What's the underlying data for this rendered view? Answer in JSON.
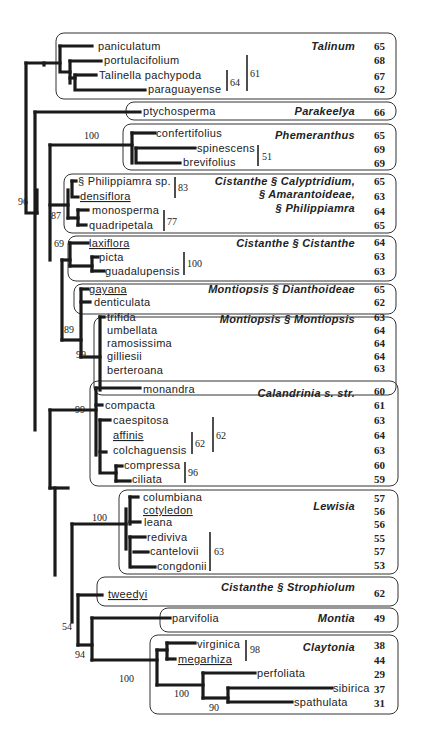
{
  "figure": {
    "groups": [
      {
        "name": "Talinum",
        "taxa": [
          {
            "label": "paniculatum",
            "value": "65"
          },
          {
            "label": "portulacifolium",
            "value": "68"
          },
          {
            "label": "Talinella pachypoda",
            "value": "67"
          },
          {
            "label": "paraguayense",
            "value": "62"
          }
        ]
      },
      {
        "name": "Parakeelya",
        "taxa": [
          {
            "label": "ptychosperma",
            "value": "66"
          }
        ]
      },
      {
        "name": "Phemeranthus",
        "taxa": [
          {
            "label": "confertifolius",
            "value": "65"
          },
          {
            "label": "spinescens",
            "value": "69"
          },
          {
            "label": "brevifolius",
            "value": "69"
          }
        ]
      },
      {
        "name_lines": [
          "Cistanthe § Calyptridium,",
          "§ Amarantoideae,",
          "§ Philippiamra"
        ],
        "taxa": [
          {
            "label": "§ Philippiamra sp.",
            "value": "65"
          },
          {
            "label": "densiflora",
            "value": "63",
            "underlined": true
          },
          {
            "label": "monosperma",
            "value": "64"
          },
          {
            "label": "quadripetala",
            "value": "65"
          }
        ]
      },
      {
        "name": "Cistanthe § Cistanthe",
        "taxa": [
          {
            "label": "laxiflora",
            "value": "64",
            "underlined": true
          },
          {
            "label": "picta",
            "value": "63"
          },
          {
            "label": "guadalupensis",
            "value": "63"
          }
        ]
      },
      {
        "name": "Montiopsis § Dianthoideae",
        "taxa": [
          {
            "label": "gayana",
            "value": "65",
            "underlined": true
          },
          {
            "label": "denticulata",
            "value": "62"
          }
        ]
      },
      {
        "name": "Montiopsis § Montiopsis",
        "taxa": [
          {
            "label": "trifida",
            "value": "63"
          },
          {
            "label": "umbellata",
            "value": "64"
          },
          {
            "label": "ramosissima",
            "value": "64"
          },
          {
            "label": "gilliesii",
            "value": "64"
          },
          {
            "label": "berteroana",
            "value": "63"
          }
        ]
      },
      {
        "name": "Calandrinia s. str.",
        "taxa": [
          {
            "label": "monandra",
            "value": "60"
          },
          {
            "label": "compacta",
            "value": "61"
          },
          {
            "label": "caespitosa",
            "value": "63"
          },
          {
            "label": "affinis",
            "value": "64",
            "underlined": true
          },
          {
            "label": "colchaguensis",
            "value": "63"
          },
          {
            "label": "compressa",
            "value": "60"
          },
          {
            "label": "ciliata",
            "value": "59"
          }
        ]
      },
      {
        "name": "Lewisia",
        "taxa": [
          {
            "label": "columbiana",
            "value": "57"
          },
          {
            "label": "cotyledon",
            "value": "56",
            "underlined": true
          },
          {
            "label": "leana",
            "value": "56"
          },
          {
            "label": "rediviva",
            "value": "55"
          },
          {
            "label": "cantelovii",
            "value": "57"
          },
          {
            "label": "congdonii",
            "value": "53"
          }
        ]
      },
      {
        "name": "Cistanthe § Strophiolum",
        "taxa": [
          {
            "label": "tweedyi",
            "value": "62",
            "underlined": true
          }
        ]
      },
      {
        "name": "Montia",
        "taxa": [
          {
            "label": "parvifolia",
            "value": "49"
          }
        ]
      },
      {
        "name": "Claytonia",
        "taxa": [
          {
            "label": "virginica",
            "value": "38"
          },
          {
            "label": "megarhiza",
            "value": "44",
            "underlined": true
          },
          {
            "label": "perfoliata",
            "value": "29"
          },
          {
            "label": "sibirica",
            "value": "37"
          },
          {
            "label": "spathulata",
            "value": "31"
          }
        ]
      }
    ],
    "support_values": {
      "talinum_inner": "64",
      "talinum_outer": "61",
      "phemeranthus_node": "100",
      "phemeranthus_bar": "51",
      "root_96": "96",
      "cistanthe_87": "87",
      "philippiamra_bar": "83",
      "monosperma_bar": "77",
      "cistanthe_69": "69",
      "guadalupensis_bar": "100",
      "montiopsis_89": "89",
      "montiopsis_99": "99",
      "calandrinia_99": "99",
      "colchaguensis_bar": "62",
      "caespitosa_bar": "62",
      "compressa_bar": "96",
      "lewisia_100": "100",
      "cantelovii_bar": "63",
      "node_54": "54",
      "node_94": "94",
      "montia_claytonia_100": "100",
      "virginica_bar": "98",
      "claytonia_100": "100",
      "sibirica_90": "90"
    }
  }
}
